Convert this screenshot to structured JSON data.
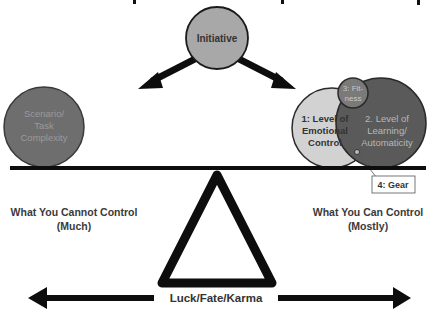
{
  "diagram": {
    "type": "seesaw-balance-concept",
    "top_circle": {
      "label": "Initiative",
      "fill": "#a8a8a8"
    },
    "left_weight": {
      "lines": [
        "Scenario/",
        "Task",
        "Complexity"
      ],
      "fill": "#6e6e6e",
      "text_color": "#9a9a9a"
    },
    "right_weights": {
      "emotional": {
        "lines": [
          "1: Level of",
          "Emotional",
          "Control"
        ],
        "fill": "#d2d2d2"
      },
      "learning": {
        "lines": [
          "2. Level of",
          "Learning/",
          "Automaticity"
        ],
        "fill": "#5a5a5a",
        "text_color": "#b8b8b8"
      },
      "fitness": {
        "lines": [
          "3: Fit-",
          "ness"
        ],
        "fill": "#7a7a7a",
        "text_color": "#c8c8c8"
      },
      "gear": {
        "label": "4: Gear"
      }
    },
    "left_caption": {
      "line1": "What You Cannot Control",
      "line2": "(Much)"
    },
    "right_caption": {
      "line1": "What You Can Control",
      "line2": "(Mostly)"
    },
    "bottom_axis": {
      "label": "Luck/Fate/Karma"
    },
    "colors": {
      "line": "#0d0d0d",
      "text": "#333333"
    }
  }
}
